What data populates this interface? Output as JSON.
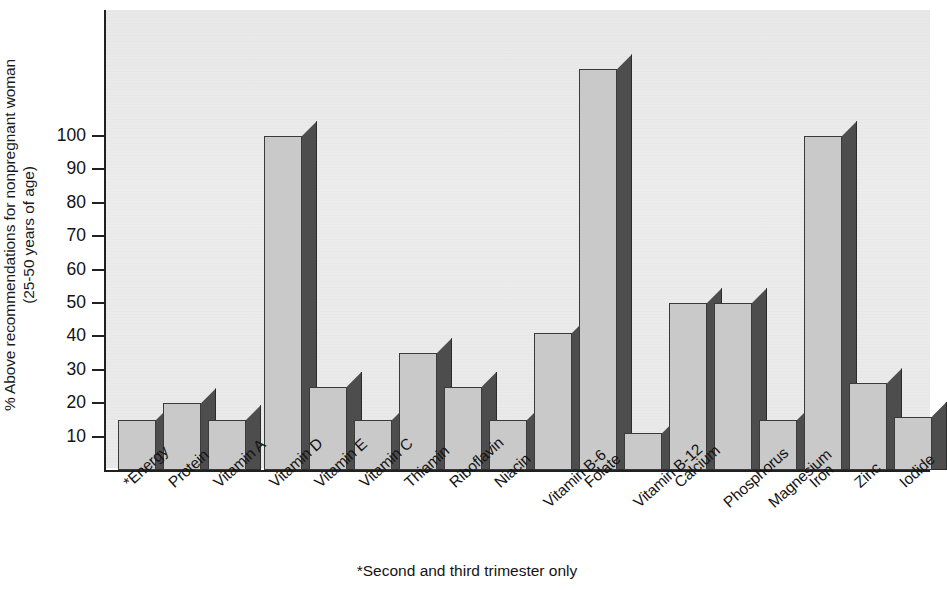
{
  "chart_data": {
    "type": "bar",
    "title": "",
    "subtitle": "",
    "xlabel": "",
    "ylabel": "% Above recommendations for nonpregnant woman (25-50 years of age)",
    "ylabel_line1": "% Above recommendations for nonpregnant woman",
    "ylabel_line2": "(25-50 years of age)",
    "ylim": [
      0,
      130
    ],
    "ytick_values": [
      10,
      20,
      30,
      40,
      50,
      60,
      70,
      80,
      90,
      100
    ],
    "ytick_labels": [
      "10",
      "20",
      "30",
      "40",
      "50",
      "60",
      "70",
      "80",
      "90",
      "100"
    ],
    "grid": false,
    "legend": null,
    "footnote": "*Second and third trimester only",
    "style": {
      "bar_front_color": "#c9c9c9",
      "bar_side_color": "#4d4d4d",
      "bar_outline_color": "#3a3a3a",
      "plot_background_color": "#ececec",
      "axis_color": "#20201f",
      "text_color": "#141414",
      "page_background_color": "#ffffff",
      "three_d": true
    },
    "categories": [
      "*Energy",
      "Protein",
      "Vitamin A",
      "Vitamin D",
      "Vitamin E",
      "Vitamin C",
      "Thiamin",
      "Riboflavin",
      "Niacin",
      "Vitamin B-6",
      "Folate",
      "Vitamin B-12",
      "Calcium",
      "Phosphorus",
      "Magnesium",
      "Iron",
      "Zinc",
      "Iodide"
    ],
    "values": [
      15,
      20,
      15,
      100,
      25,
      15,
      35,
      25,
      15,
      41,
      120,
      11,
      50,
      50,
      15,
      100,
      26,
      16
    ],
    "bars": [
      {
        "category": "*Energy",
        "value": 15,
        "x_px": 12,
        "width_px": 38,
        "gap_after": false
      },
      {
        "category": "Protein",
        "value": 20,
        "x_px": 57,
        "width_px": 38,
        "gap_after": false
      },
      {
        "category": "Vitamin A",
        "value": 15,
        "x_px": 102,
        "width_px": 38,
        "gap_after": true
      },
      {
        "category": "Vitamin D",
        "value": 100,
        "x_px": 158,
        "width_px": 38,
        "gap_after": false
      },
      {
        "category": "Vitamin E",
        "value": 25,
        "x_px": 203,
        "width_px": 38,
        "gap_after": false
      },
      {
        "category": "Vitamin C",
        "value": 15,
        "x_px": 248,
        "width_px": 38,
        "gap_after": false
      },
      {
        "category": "Thiamin",
        "value": 35,
        "x_px": 293,
        "width_px": 38,
        "gap_after": false
      },
      {
        "category": "Riboflavin",
        "value": 25,
        "x_px": 338,
        "width_px": 38,
        "gap_after": false
      },
      {
        "category": "Niacin",
        "value": 15,
        "x_px": 383,
        "width_px": 38,
        "gap_after": false
      },
      {
        "category": "Vitamin B-6",
        "value": 41,
        "x_px": 428,
        "width_px": 38,
        "gap_after": false
      },
      {
        "category": "Folate",
        "value": 120,
        "x_px": 473,
        "width_px": 38,
        "gap_after": false
      },
      {
        "category": "Vitamin B-12",
        "value": 11,
        "x_px": 518,
        "width_px": 38,
        "gap_after": false
      },
      {
        "category": "Calcium",
        "value": 50,
        "x_px": 563,
        "width_px": 38,
        "gap_after": false
      },
      {
        "category": "Phosphorus",
        "value": 50,
        "x_px": 608,
        "width_px": 38,
        "gap_after": false
      },
      {
        "category": "Magnesium",
        "value": 15,
        "x_px": 653,
        "width_px": 38,
        "gap_after": false
      },
      {
        "category": "Iron",
        "value": 100,
        "x_px": 698,
        "width_px": 38,
        "gap_after": false
      },
      {
        "category": "Zinc",
        "value": 26,
        "x_px": 743,
        "width_px": 38,
        "gap_after": false
      },
      {
        "category": "Iodide",
        "value": 16,
        "x_px": 788,
        "width_px": 38,
        "gap_after": false
      }
    ]
  }
}
